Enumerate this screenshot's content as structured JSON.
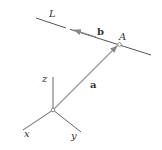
{
  "diagram": {
    "labels": {
      "line": "L",
      "point": "A",
      "vector_a": "a",
      "vector_b": "b",
      "axis_x": "x",
      "axis_y": "y",
      "axis_z": "z"
    },
    "colors": {
      "line": "#555555",
      "vector": "#888888",
      "text": "#333333"
    }
  }
}
